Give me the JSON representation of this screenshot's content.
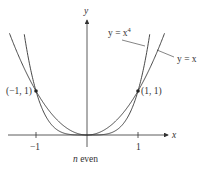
{
  "chart_data": {
    "type": "line",
    "title": "",
    "caption": "n even",
    "xlabel": "x",
    "ylabel": "y",
    "x_ticks": [
      -1,
      1
    ],
    "x_tick_labels": [
      "−1",
      "1"
    ],
    "series": [
      {
        "name": "y = x^4",
        "label": "y = x⁴",
        "x": [
          -1.25,
          -1,
          -0.5,
          0,
          0.5,
          1,
          1.25
        ],
        "values": [
          2.44,
          1,
          0.0625,
          0,
          0.0625,
          1,
          2.44
        ]
      },
      {
        "name": "y = x^2",
        "label": "y = x",
        "x": [
          -1.5,
          -1,
          -0.5,
          0,
          0.5,
          1,
          1.5
        ],
        "values": [
          2.25,
          1,
          0.25,
          0,
          0.25,
          1,
          2.25
        ]
      }
    ],
    "points": [
      {
        "label": "(−1, 1)",
        "x": -1,
        "y": 1
      },
      {
        "label": "(1, 1)",
        "x": 1,
        "y": 1
      }
    ],
    "grid": false,
    "legend": "inline annotations"
  },
  "labels": {
    "y_axis": "y",
    "x_axis": "x",
    "tick_neg1": "−1",
    "tick_pos1": "1",
    "point_left": "(−1, 1)",
    "point_right": "(1, 1)",
    "curve_x4_prefix": "y = x",
    "curve_x4_exp": "4",
    "curve_x2": "y = x",
    "caption_n": "n",
    "caption_rest": " even"
  }
}
